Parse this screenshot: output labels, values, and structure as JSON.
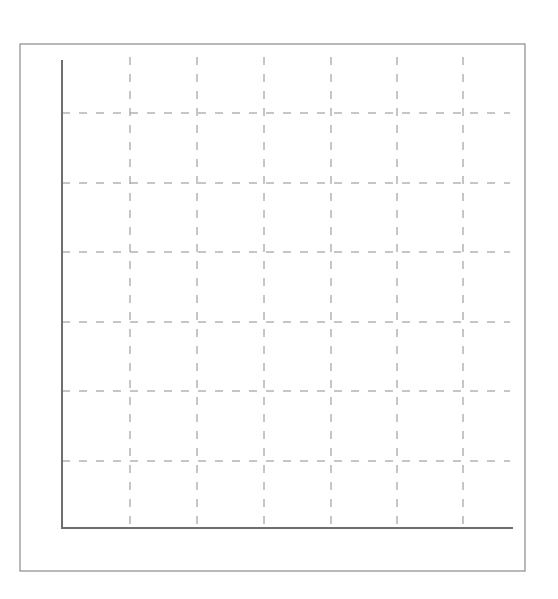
{
  "chart_data": {
    "type": "line",
    "title": "",
    "xlabel": "",
    "ylabel": "",
    "categories": [],
    "series": [],
    "x_ticks": [],
    "y_ticks": [],
    "grid": true,
    "grid_style": "dashed",
    "grid_vertical_count": 6,
    "grid_horizontal_count": 6,
    "legend": null,
    "xlim": [
      0,
      7
    ],
    "ylim": [
      0,
      7
    ],
    "note": "Empty dashed grid with axes; no data, labels or ticks visible"
  },
  "colors": {
    "background": "#ffffff",
    "frame": "#8a8a8a",
    "axis": "#6e6e6e",
    "grid": "#8c8c8c"
  },
  "layout": {
    "frame": {
      "x1": 20,
      "y1": 44,
      "x2": 525,
      "y2": 571
    },
    "axis_origin": {
      "x": 62,
      "y": 528
    },
    "axis_y_top": 61,
    "axis_x_right": 512,
    "grid_x": [
      130,
      197,
      264,
      331,
      397,
      463
    ],
    "grid_y": [
      113,
      183,
      252,
      322,
      391,
      461
    ],
    "grid_top": 57,
    "grid_right": 510
  }
}
